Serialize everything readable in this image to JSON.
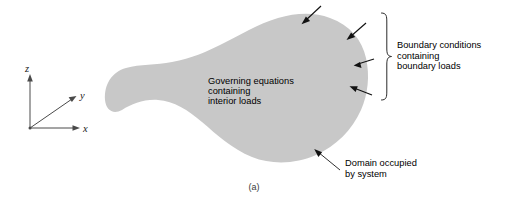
{
  "figure": {
    "caption": "(a)",
    "domain_fill_color": "#c8c8c8",
    "background_color": "#ffffff",
    "stroke_color": "#111111"
  },
  "axes": {
    "z_label": "z",
    "y_label": "y",
    "x_label": "x"
  },
  "annotations": {
    "interior": {
      "line1": "Governing equations",
      "line2": "containing",
      "line3": "interior loads"
    },
    "boundary": {
      "line1": "Boundary conditions",
      "line2": "containing",
      "line3": "boundary loads"
    },
    "domain": {
      "line1": "Domain occupied",
      "line2": "by system"
    }
  },
  "boundary_load_arrows": {
    "count": 4,
    "description": "arrows-pointing-inward-at-boundary"
  }
}
